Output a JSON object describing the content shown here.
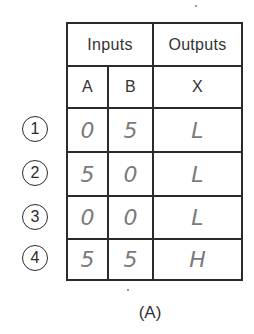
{
  "table": {
    "header": {
      "inputs_label": "Inputs",
      "outputs_label": "Outputs"
    },
    "columns": [
      "A",
      "B",
      "X"
    ],
    "rows": [
      {
        "index": "1",
        "A": "0",
        "B": "5",
        "X": "L"
      },
      {
        "index": "2",
        "A": "5",
        "B": "0",
        "X": "L"
      },
      {
        "index": "3",
        "A": "0",
        "B": "0",
        "X": "L"
      },
      {
        "index": "4",
        "A": "5",
        "B": "5",
        "X": "H"
      }
    ]
  },
  "caption": "(A)",
  "colors": {
    "grid_line": "#2b2b2b",
    "printed_text": "#333333",
    "handwriting": "#7a7a7a"
  }
}
